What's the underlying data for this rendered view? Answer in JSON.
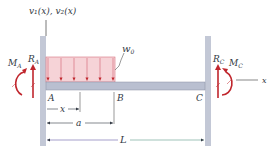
{
  "diagram": {
    "axis_label_top": "v₁(x), v₂(x)",
    "axis_label_x": "x",
    "load_label": "w",
    "load_label_sub": "0",
    "points": [
      "A",
      "B",
      "C"
    ],
    "reaction_left_force": "R",
    "reaction_left_force_sub": "A",
    "reaction_left_moment": "M",
    "reaction_left_moment_sub": "A",
    "reaction_right_force": "R",
    "reaction_right_force_sub": "C",
    "reaction_right_moment": "M",
    "reaction_right_moment_sub": "C",
    "dimensions": {
      "x": "x",
      "a": "a",
      "L": "L"
    },
    "load_arrow_count": 6,
    "colors": {
      "wall": "#c3c8d6",
      "beam": "#b9bfd0",
      "load_fill": "#f6d3d7",
      "load_stroke": "#d7717e",
      "reaction": "#c0262d",
      "dim_line": "#333a45"
    }
  }
}
